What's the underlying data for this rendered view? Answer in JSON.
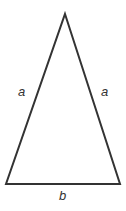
{
  "figure": {
    "kind": "isosceles-triangle-diagram",
    "canvas": {
      "width": 126,
      "height": 211,
      "background": "#ffffff"
    },
    "stroke": {
      "color": "#333333",
      "width": 2
    },
    "vertices": {
      "apex": {
        "x": 65,
        "y": 14
      },
      "bottom_left": {
        "x": 6,
        "y": 184
      },
      "bottom_right": {
        "x": 120,
        "y": 184
      }
    },
    "labels": {
      "left_leg": "a",
      "right_leg": "a",
      "base": "b"
    }
  }
}
